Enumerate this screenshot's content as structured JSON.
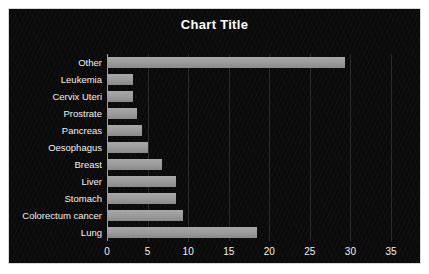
{
  "chart_data": {
    "type": "bar",
    "orientation": "horizontal",
    "title": "Chart Title",
    "xlabel": "",
    "ylabel": "",
    "categories": [
      "Other",
      "Leukemia",
      "Cervix Uteri",
      "Prostrate",
      "Pancreas",
      "Oesophagus",
      "Breast",
      "Liver",
      "Stomach",
      "Colorectum cancer",
      "Lung"
    ],
    "values": [
      29.3,
      3.2,
      3.2,
      3.7,
      4.3,
      5.1,
      6.8,
      8.5,
      8.5,
      9.4,
      18.5
    ],
    "xlim": [
      0,
      35
    ],
    "xticks": [
      0,
      5,
      10,
      15,
      20,
      25,
      30,
      35
    ],
    "xtick_labels": [
      "0",
      "5",
      "10",
      "15",
      "20",
      "25",
      "30",
      "35"
    ],
    "grid": true,
    "grid_axis": "x",
    "legend": false,
    "legend_position": "none"
  },
  "style": {
    "background_color": "#0a0a0a",
    "bar_color": "#9a9a9a",
    "text_color": "#f2f2f2",
    "title_color": "#ffffff",
    "grid_color": "#2e2e2e",
    "border_color": "#d8d8d8"
  }
}
